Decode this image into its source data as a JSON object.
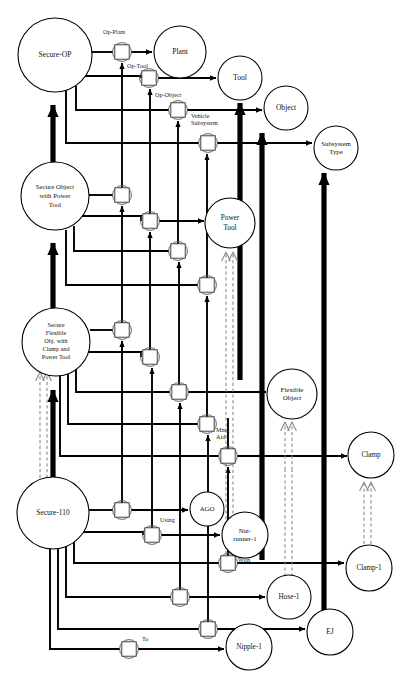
{
  "diagram": {
    "type": "node-link-graph",
    "background": "#ffffff",
    "line_color": "#000000",
    "dashed_color": "#8a8a8a",
    "node_fill": "#ffffff",
    "nodes": [
      {
        "id": "secure-op",
        "label": "Secure-OP",
        "x": 55,
        "y": 55,
        "r": 37,
        "font": 7.6,
        "lines": [
          "Secure-OP"
        ]
      },
      {
        "id": "plant",
        "label": "Plant",
        "x": 180,
        "y": 52,
        "r": 26,
        "font": 7.6,
        "lines": [
          "Plant"
        ]
      },
      {
        "id": "tool",
        "label": "Tool",
        "x": 240,
        "y": 78,
        "r": 22,
        "font": 7.6,
        "lines": [
          "Tool"
        ]
      },
      {
        "id": "object",
        "label": "Object",
        "x": 286,
        "y": 108,
        "r": 22,
        "font": 7.6,
        "lines": [
          "Object"
        ]
      },
      {
        "id": "subsystem-type",
        "label": "Subsystem Type",
        "x": 336,
        "y": 148,
        "r": 22,
        "font": 6.8,
        "lines": [
          "Subsystem",
          "Type"
        ]
      },
      {
        "id": "secure-object-pt",
        "label": "Secure Object with Power Tool",
        "x": 55,
        "y": 196,
        "r": 34,
        "font": 6.8,
        "lines": [
          "Secure Object",
          "with Power",
          "Tool"
        ]
      },
      {
        "id": "power-tool",
        "label": "Power Tool",
        "x": 230,
        "y": 223,
        "r": 25,
        "font": 7.2,
        "lines": [
          "Power",
          "Tool"
        ]
      },
      {
        "id": "secure-flex",
        "label": "Secure Flexible Obj. with Clamp and Power Tool",
        "x": 56,
        "y": 342,
        "r": 34,
        "font": 6.2,
        "lines": [
          "Secure",
          "Flexible",
          "Obj. with",
          "Clamp and",
          "Power Tool"
        ]
      },
      {
        "id": "flexible-object",
        "label": "Flexible Object",
        "x": 292,
        "y": 394,
        "r": 25,
        "font": 7.0,
        "lines": [
          "Flexible",
          "Object"
        ]
      },
      {
        "id": "clamp",
        "label": "Clamp",
        "x": 371,
        "y": 455,
        "r": 23,
        "font": 7.2,
        "lines": [
          "Clamp"
        ]
      },
      {
        "id": "secure-110",
        "label": "Secure-110",
        "x": 53,
        "y": 513,
        "r": 36,
        "font": 7.4,
        "lines": [
          "Secure-110"
        ]
      },
      {
        "id": "ago",
        "label": "AGO",
        "x": 207,
        "y": 509,
        "r": 17,
        "font": 7.0,
        "lines": [
          "AGO"
        ]
      },
      {
        "id": "nut-runner-1",
        "label": "Nut-runner-1",
        "x": 245,
        "y": 535,
        "r": 23,
        "font": 6.8,
        "lines": [
          "Nut-",
          "runner-1"
        ]
      },
      {
        "id": "clamp-1",
        "label": "Clamp-1",
        "x": 369,
        "y": 568,
        "r": 23,
        "font": 7.2,
        "lines": [
          "Clamp-1"
        ]
      },
      {
        "id": "hose-1",
        "label": "Hose-1",
        "x": 289,
        "y": 597,
        "r": 22,
        "font": 7.2,
        "lines": [
          "Hose-1"
        ]
      },
      {
        "id": "ej",
        "label": "EJ",
        "x": 330,
        "y": 632,
        "r": 23,
        "font": 7.4,
        "lines": [
          "EJ"
        ]
      },
      {
        "id": "nipple-1",
        "label": "Nipple-1",
        "x": 249,
        "y": 647,
        "r": 23,
        "font": 7.2,
        "lines": [
          "Nipple-1"
        ]
      }
    ],
    "connectors": [
      {
        "id": "conn-op-plant",
        "x": 122,
        "y": 52,
        "label": "Op-Plant",
        "label_x": 103,
        "label_y": 34
      },
      {
        "id": "conn-op-tool",
        "x": 149,
        "y": 78,
        "label": "Op-Tool",
        "label_x": 127,
        "label_y": 68
      },
      {
        "id": "conn-op-object",
        "x": 178,
        "y": 110,
        "label": "Op-Object",
        "label_x": 155,
        "label_y": 97
      },
      {
        "id": "conn-vehicle-subsys",
        "x": 208,
        "y": 143,
        "label": "Vehicle Subsystem",
        "label_x": 191,
        "label_y": 118
      },
      {
        "id": "conn-sopt-a",
        "x": 122,
        "y": 195,
        "label": "",
        "label_x": 0,
        "label_y": 0
      },
      {
        "id": "conn-sopt-b",
        "x": 150,
        "y": 221,
        "label": "",
        "label_x": 0,
        "label_y": 0
      },
      {
        "id": "conn-sopt-c",
        "x": 178,
        "y": 251,
        "label": "",
        "label_x": 0,
        "label_y": 0
      },
      {
        "id": "conn-sopt-d",
        "x": 207,
        "y": 285,
        "label": "",
        "label_x": 0,
        "label_y": 0
      },
      {
        "id": "conn-sf-a",
        "x": 122,
        "y": 330,
        "label": "",
        "label_x": 0,
        "label_y": 0
      },
      {
        "id": "conn-sf-b",
        "x": 150,
        "y": 357,
        "label": "",
        "label_x": 0,
        "label_y": 0
      },
      {
        "id": "conn-sf-c",
        "x": 179,
        "y": 392,
        "label": "",
        "label_x": 0,
        "label_y": 0
      },
      {
        "id": "conn-sf-d",
        "x": 207,
        "y": 424,
        "label": "",
        "label_x": 0,
        "label_y": 0
      },
      {
        "id": "conn-mntg-aid",
        "x": 228,
        "y": 456,
        "label": "Mntg Aid",
        "label_x": 216,
        "label_y": 432
      },
      {
        "id": "conn-s110-a",
        "x": 122,
        "y": 510,
        "label": "",
        "label_x": 0,
        "label_y": 0
      },
      {
        "id": "conn-using",
        "x": 152,
        "y": 535,
        "label": "Using",
        "label_x": 160,
        "label_y": 522
      },
      {
        "id": "conn-with",
        "x": 228,
        "y": 563,
        "label": "With",
        "label_x": 238,
        "label_y": 562
      },
      {
        "id": "conn-hose",
        "x": 180,
        "y": 597,
        "label": "",
        "label_x": 0,
        "label_y": 0
      },
      {
        "id": "conn-ej",
        "x": 208,
        "y": 629,
        "label": "",
        "label_x": 0,
        "label_y": 0
      },
      {
        "id": "conn-to",
        "x": 129,
        "y": 649,
        "label": "To",
        "label_x": 142,
        "label_y": 641
      }
    ],
    "edge_labels": [
      "Op-Plant",
      "Op-Tool",
      "Op-Object",
      "Vehicle Subsystem",
      "Mntg Aid",
      "Using",
      "With",
      "To"
    ],
    "generalization_links": [
      {
        "from": "power-tool",
        "to": "tool",
        "style": "dashed"
      },
      {
        "from": "flexible-object",
        "to": "object",
        "style": "dashed"
      },
      {
        "from": "clamp",
        "to": "clamp-1",
        "style": "dashed"
      },
      {
        "from": "secure-flex",
        "to": "secure-110",
        "style": "dashed"
      }
    ]
  }
}
